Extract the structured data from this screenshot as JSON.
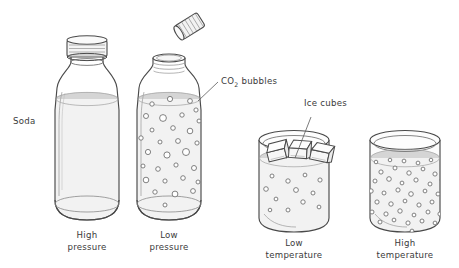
{
  "figure": {
    "background_color": "#ffffff",
    "ink_color": "#444444",
    "liquid_color": "#d8d8d8",
    "text_color": "#3a3a3a"
  },
  "annotations": {
    "soda": "Soda",
    "co2_prefix": "CO",
    "co2_subscript": "2",
    "co2_suffix": " bubbles",
    "ice_cubes": "Ice cubes"
  },
  "panels": [
    {
      "id": "high-pressure",
      "vessel": "bottle",
      "capped": true,
      "caption_line1": "High",
      "caption_line2": "pressure",
      "bubble_count": 0,
      "bubble_density": "none"
    },
    {
      "id": "low-pressure",
      "vessel": "bottle",
      "capped": false,
      "cap_flying": true,
      "caption_line1": "Low",
      "caption_line2": "pressure",
      "bubble_count": 30,
      "bubble_density": "medium"
    },
    {
      "id": "low-temperature",
      "vessel": "glass",
      "ice_cube_count": 3,
      "caption_line1": "Low",
      "caption_line2": "temperature",
      "bubble_count": 12,
      "bubble_density": "sparse"
    },
    {
      "id": "high-temperature",
      "vessel": "glass",
      "ice_cube_count": 0,
      "caption_line1": "High",
      "caption_line2": "temperature",
      "bubble_count": 44,
      "bubble_density": "dense"
    }
  ],
  "bubbles": {
    "low_pressure": [
      {
        "x": 152,
        "y": 104,
        "r": 2.2
      },
      {
        "x": 170,
        "y": 99,
        "r": 2.6
      },
      {
        "x": 190,
        "y": 101,
        "r": 2.4
      },
      {
        "x": 196,
        "y": 110,
        "r": 2.1
      },
      {
        "x": 146,
        "y": 116,
        "r": 2.5
      },
      {
        "x": 163,
        "y": 118,
        "r": 3.4
      },
      {
        "x": 182,
        "y": 115,
        "r": 2.2
      },
      {
        "x": 199,
        "y": 121,
        "r": 2.0
      },
      {
        "x": 152,
        "y": 130,
        "r": 2.0
      },
      {
        "x": 173,
        "y": 128,
        "r": 2.3
      },
      {
        "x": 190,
        "y": 131,
        "r": 2.8
      },
      {
        "x": 141,
        "y": 138,
        "r": 2.2
      },
      {
        "x": 160,
        "y": 142,
        "r": 2.0
      },
      {
        "x": 178,
        "y": 141,
        "r": 2.4
      },
      {
        "x": 197,
        "y": 143,
        "r": 2.1
      },
      {
        "x": 148,
        "y": 152,
        "r": 2.6
      },
      {
        "x": 167,
        "y": 155,
        "r": 3.1
      },
      {
        "x": 186,
        "y": 152,
        "r": 3.5
      },
      {
        "x": 143,
        "y": 166,
        "r": 2.0
      },
      {
        "x": 158,
        "y": 169,
        "r": 2.3
      },
      {
        "x": 176,
        "y": 165,
        "r": 2.1
      },
      {
        "x": 194,
        "y": 168,
        "r": 2.5
      },
      {
        "x": 146,
        "y": 180,
        "r": 2.8
      },
      {
        "x": 165,
        "y": 181,
        "r": 2.1
      },
      {
        "x": 183,
        "y": 178,
        "r": 2.3
      },
      {
        "x": 198,
        "y": 182,
        "r": 2.0
      },
      {
        "x": 155,
        "y": 192,
        "r": 2.2
      },
      {
        "x": 175,
        "y": 194,
        "r": 2.9
      },
      {
        "x": 193,
        "y": 191,
        "r": 2.4
      },
      {
        "x": 165,
        "y": 205,
        "r": 2.0
      }
    ],
    "low_temperature": [
      {
        "x": 272,
        "y": 176,
        "r": 2.0
      },
      {
        "x": 288,
        "y": 181,
        "r": 2.2
      },
      {
        "x": 305,
        "y": 175,
        "r": 1.9
      },
      {
        "x": 320,
        "y": 180,
        "r": 2.1
      },
      {
        "x": 266,
        "y": 189,
        "r": 2.3
      },
      {
        "x": 296,
        "y": 190,
        "r": 2.4
      },
      {
        "x": 313,
        "y": 193,
        "r": 2.0
      },
      {
        "x": 276,
        "y": 199,
        "r": 1.9
      },
      {
        "x": 303,
        "y": 202,
        "r": 2.2
      },
      {
        "x": 288,
        "y": 210,
        "r": 2.0
      },
      {
        "x": 319,
        "y": 207,
        "r": 1.9
      },
      {
        "x": 270,
        "y": 210,
        "r": 1.8
      }
    ],
    "high_temperature": [
      {
        "x": 381,
        "y": 172,
        "r": 2.1
      },
      {
        "x": 395,
        "y": 168,
        "r": 2.0
      },
      {
        "x": 409,
        "y": 173,
        "r": 2.2
      },
      {
        "x": 423,
        "y": 169,
        "r": 1.9
      },
      {
        "x": 435,
        "y": 174,
        "r": 2.1
      },
      {
        "x": 375,
        "y": 181,
        "r": 2.0
      },
      {
        "x": 389,
        "y": 179,
        "r": 2.3
      },
      {
        "x": 402,
        "y": 183,
        "r": 1.9
      },
      {
        "x": 416,
        "y": 180,
        "r": 2.1
      },
      {
        "x": 430,
        "y": 184,
        "r": 2.0
      },
      {
        "x": 442,
        "y": 180,
        "r": 1.9
      },
      {
        "x": 371,
        "y": 191,
        "r": 2.2
      },
      {
        "x": 384,
        "y": 193,
        "r": 2.0
      },
      {
        "x": 398,
        "y": 190,
        "r": 2.1
      },
      {
        "x": 411,
        "y": 194,
        "r": 2.3
      },
      {
        "x": 425,
        "y": 191,
        "r": 1.9
      },
      {
        "x": 438,
        "y": 194,
        "r": 2.0
      },
      {
        "x": 377,
        "y": 202,
        "r": 2.1
      },
      {
        "x": 391,
        "y": 204,
        "r": 2.2
      },
      {
        "x": 405,
        "y": 201,
        "r": 1.9
      },
      {
        "x": 419,
        "y": 205,
        "r": 2.1
      },
      {
        "x": 432,
        "y": 202,
        "r": 2.0
      },
      {
        "x": 444,
        "y": 200,
        "r": 1.8
      },
      {
        "x": 372,
        "y": 212,
        "r": 2.0
      },
      {
        "x": 386,
        "y": 214,
        "r": 2.1
      },
      {
        "x": 400,
        "y": 211,
        "r": 2.2
      },
      {
        "x": 414,
        "y": 215,
        "r": 1.9
      },
      {
        "x": 428,
        "y": 212,
        "r": 2.0
      },
      {
        "x": 440,
        "y": 214,
        "r": 2.1
      },
      {
        "x": 380,
        "y": 222,
        "r": 2.0
      },
      {
        "x": 394,
        "y": 220,
        "r": 1.9
      },
      {
        "x": 408,
        "y": 223,
        "r": 2.1
      },
      {
        "x": 422,
        "y": 221,
        "r": 2.0
      },
      {
        "x": 435,
        "y": 223,
        "r": 1.9
      },
      {
        "x": 376,
        "y": 162,
        "r": 1.8
      },
      {
        "x": 404,
        "y": 161,
        "r": 1.9
      },
      {
        "x": 431,
        "y": 160,
        "r": 1.8
      },
      {
        "x": 418,
        "y": 163,
        "r": 1.9
      },
      {
        "x": 390,
        "y": 160,
        "r": 1.8
      },
      {
        "x": 444,
        "y": 189,
        "r": 1.8
      },
      {
        "x": 368,
        "y": 201,
        "r": 1.9
      },
      {
        "x": 446,
        "y": 210,
        "r": 1.8
      },
      {
        "x": 366,
        "y": 215,
        "r": 1.8
      },
      {
        "x": 412,
        "y": 231,
        "r": 1.9
      }
    ]
  },
  "ice_cubes": [
    {
      "x": 276,
      "y": 152,
      "rot": -14
    },
    {
      "x": 298,
      "y": 150,
      "rot": 4
    },
    {
      "x": 320,
      "y": 153,
      "rot": 12
    }
  ]
}
